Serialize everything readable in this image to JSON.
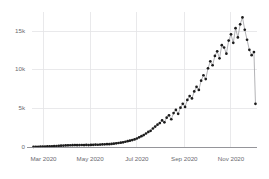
{
  "chart_data": {
    "type": "line",
    "title": "",
    "subtitle": "",
    "xlabel": "",
    "ylabel": "",
    "grid": true,
    "legend": null,
    "legend_position": "none",
    "marker": "circle",
    "x_type": "date",
    "xlim": [
      "2020-02-15",
      "2020-12-05"
    ],
    "ylim": [
      0,
      17500
    ],
    "ytick_labels": [
      "0",
      "5k",
      "10k",
      "15k"
    ],
    "ytick_values": [
      0,
      5000,
      10000,
      15000
    ],
    "xtick_labels": [
      "Mar 2020",
      "May 2020",
      "Jul 2020",
      "Sep 2020",
      "Nov 2020"
    ],
    "xtick_values": [
      "2020-03-01",
      "2020-05-01",
      "2020-07-01",
      "2020-09-01",
      "2020-11-01"
    ],
    "colors": {
      "marker": "#1c1c1c",
      "line": "#9a9a9e",
      "grid": "#e3e3e6",
      "axis": "#8a8a8f",
      "tick_label": "#6b6b70",
      "background": "#ffffff"
    },
    "series": [
      {
        "name": "Daily count",
        "x": [
          "2020-02-17",
          "2020-02-20",
          "2020-02-23",
          "2020-02-26",
          "2020-02-29",
          "2020-03-03",
          "2020-03-06",
          "2020-03-09",
          "2020-03-12",
          "2020-03-15",
          "2020-03-18",
          "2020-03-21",
          "2020-03-24",
          "2020-03-27",
          "2020-03-30",
          "2020-04-02",
          "2020-04-05",
          "2020-04-08",
          "2020-04-11",
          "2020-04-14",
          "2020-04-17",
          "2020-04-20",
          "2020-04-23",
          "2020-04-26",
          "2020-04-29",
          "2020-05-02",
          "2020-05-05",
          "2020-05-08",
          "2020-05-11",
          "2020-05-14",
          "2020-05-17",
          "2020-05-20",
          "2020-05-23",
          "2020-05-26",
          "2020-05-29",
          "2020-06-01",
          "2020-06-04",
          "2020-06-07",
          "2020-06-10",
          "2020-06-13",
          "2020-06-16",
          "2020-06-19",
          "2020-06-22",
          "2020-06-25",
          "2020-06-28",
          "2020-07-01",
          "2020-07-04",
          "2020-07-07",
          "2020-07-10",
          "2020-07-13",
          "2020-07-16",
          "2020-07-19",
          "2020-07-22",
          "2020-07-25",
          "2020-07-28",
          "2020-07-31",
          "2020-08-03",
          "2020-08-06",
          "2020-08-09",
          "2020-08-12",
          "2020-08-15",
          "2020-08-18",
          "2020-08-21",
          "2020-08-24",
          "2020-08-27",
          "2020-08-30",
          "2020-09-02",
          "2020-09-05",
          "2020-09-08",
          "2020-09-11",
          "2020-09-14",
          "2020-09-17",
          "2020-09-20",
          "2020-09-23",
          "2020-09-26",
          "2020-09-29",
          "2020-10-02",
          "2020-10-05",
          "2020-10-08",
          "2020-10-11",
          "2020-10-14",
          "2020-10-17",
          "2020-10-20",
          "2020-10-23",
          "2020-10-26",
          "2020-10-29",
          "2020-11-01",
          "2020-11-04",
          "2020-11-07",
          "2020-11-10",
          "2020-11-13",
          "2020-11-16",
          "2020-11-19",
          "2020-11-22",
          "2020-11-25",
          "2020-11-28",
          "2020-12-01",
          "2020-12-03"
        ],
        "values": [
          20,
          30,
          35,
          40,
          55,
          60,
          70,
          85,
          95,
          110,
          130,
          150,
          170,
          185,
          200,
          215,
          230,
          240,
          250,
          235,
          245,
          260,
          250,
          265,
          255,
          270,
          285,
          300,
          290,
          310,
          330,
          350,
          370,
          360,
          395,
          430,
          470,
          520,
          560,
          610,
          680,
          750,
          820,
          900,
          980,
          1100,
          1250,
          1400,
          1550,
          1750,
          1950,
          2100,
          2400,
          2650,
          2900,
          3100,
          3450,
          3200,
          3800,
          4100,
          3600,
          4400,
          4800,
          4300,
          5100,
          5600,
          5200,
          6100,
          6600,
          6300,
          7200,
          7800,
          7400,
          8600,
          9300,
          8800,
          10200,
          11100,
          10600,
          11800,
          12400,
          11500,
          13200,
          12900,
          12100,
          13800,
          14600,
          13500,
          15400,
          14200,
          15900,
          16800,
          15200,
          13900,
          12600,
          11900,
          12300,
          5600
        ]
      }
    ]
  },
  "plot_geometry": {
    "left": 32,
    "right": 257,
    "top": 12,
    "bottom": 147
  }
}
